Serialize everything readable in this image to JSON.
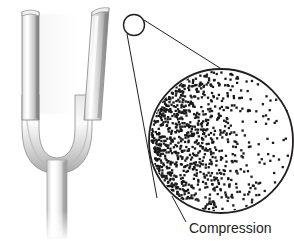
{
  "figure": {
    "background_color": "#ffffff"
  },
  "tuning_fork": {
    "name": "tuning-fork",
    "description": "Metal tuning fork, U-shaped, with left tine vertical and right tine flexed outward",
    "metal_light": "#fdfdfd",
    "metal_mid": "#d9d9d9",
    "metal_dark": "#8a8a8a",
    "outline_color": "#7a7a7a",
    "left_tine": {
      "name": "left-tine",
      "state": "vertical"
    },
    "right_tine": {
      "name": "right-tine",
      "state": "flexed-outward"
    },
    "bend": {
      "name": "fork-bend"
    },
    "stem": {
      "name": "fork-stem",
      "fade": "bottom"
    }
  },
  "callout": {
    "name": "magnification-callout",
    "line_color": "#231f20",
    "source_circle": {
      "name": "callout-source-circle",
      "cx": 134,
      "cy": 25,
      "r": 10.5
    },
    "magnified_circle": {
      "name": "magnified-air-circle",
      "cx": 221,
      "cy": 141,
      "r": 72,
      "border_color": "#231f20",
      "fill_color": "#ffffff"
    }
  },
  "air_particles": {
    "name": "air-particle-field",
    "dot_color": "#1a1a1a",
    "dot_size": 2.3,
    "count": 900,
    "description": "Dots representing air molecules, densely packed at the left (compression) and thinning toward the right (rarefaction)",
    "density_gradient": {
      "left_edge": "dense",
      "right_edge": "sparse"
    }
  },
  "annotations": {
    "compression": {
      "name": "compression-label",
      "label": "Compression",
      "leader_line": {
        "name": "compression-leader-line",
        "x1": 172,
        "y1": 196,
        "x2": 186,
        "y2": 222
      },
      "text_x": 189,
      "text_y": 233
    }
  }
}
